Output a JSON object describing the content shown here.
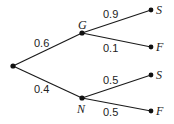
{
  "diagram": {
    "type": "probability-tree",
    "root": {
      "id": "root"
    },
    "branches": [
      {
        "id": "G",
        "label": "G",
        "prob": "0.6",
        "children": [
          {
            "label": "S",
            "prob": "0.9"
          },
          {
            "label": "F",
            "prob": "0.1"
          }
        ]
      },
      {
        "id": "N",
        "label": "N",
        "prob": "0.4",
        "children": [
          {
            "label": "S",
            "prob": "0.5"
          },
          {
            "label": "F",
            "prob": "0.5"
          }
        ]
      }
    ]
  }
}
